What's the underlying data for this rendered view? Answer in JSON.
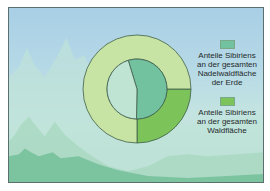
{
  "chart_data": {
    "type": "pie",
    "subtype": "nested-donut",
    "title": "",
    "series": [
      {
        "name": "Anteile Sibiriens an der gesamten Nadelwaldfläche der Erde",
        "ring": "inner",
        "slices": [
          {
            "label": "Sibirien",
            "value": 55,
            "color": "#72c29f"
          },
          {
            "label": "Rest der Welt",
            "value": 45,
            "color": "#bfe4d4"
          }
        ],
        "start_angle_deg": -17
      },
      {
        "name": "Anteile Sibiriens an der gesamten Waldfläche",
        "ring": "outer",
        "slices": [
          {
            "label": "Sibirien",
            "value": 25,
            "color": "#7cc45a"
          },
          {
            "label": "Rest der Welt",
            "value": 75,
            "color": "#c8e4a4"
          }
        ],
        "start_angle_deg": 90
      }
    ],
    "legend": [
      {
        "label": "Anteile Sibiriens\nan der gesamten\nNadelwaldfläche\nder Erde",
        "color": "#72c29f"
      },
      {
        "label": "Anteile Sibiriens\nan der gesamten\nWaldfläche",
        "color": "#7cc45a"
      }
    ],
    "legend_position": "right"
  },
  "colors": {
    "frame_border": "#5c6f6f",
    "ring_outline": "#3f5e4b"
  }
}
